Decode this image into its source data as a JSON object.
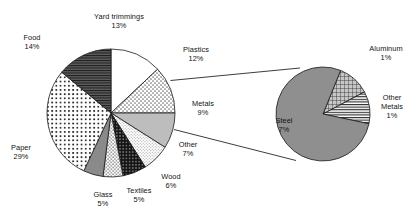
{
  "figure": {
    "background_color": "#ffffff",
    "text_color": "#141414"
  },
  "chart_data": {
    "type": "pie",
    "title": "",
    "subtitle": "",
    "xlabel": "",
    "ylabel": "",
    "grid": false,
    "legend": "none",
    "label_format": "name + percent",
    "charts": [
      {
        "name": "main-pie",
        "categories": [
          "Yard trimmings",
          "Plastics",
          "Metals",
          "Other",
          "Wood",
          "Textiles",
          "Glass",
          "Paper",
          "Food"
        ],
        "values": [
          13,
          12,
          9,
          7,
          6,
          5,
          5,
          29,
          14
        ],
        "units": "percent",
        "start_angle_deg": 0,
        "direction": "clockwise",
        "total": 100
      },
      {
        "name": "metals-detail-pie",
        "parent_slice": "Metals",
        "categories": [
          "Steel",
          "Aluminum",
          "Other Metals"
        ],
        "values": [
          7,
          1,
          1
        ],
        "units": "percent",
        "start_angle_deg": 0,
        "direction": "clockwise",
        "total": 9
      }
    ]
  },
  "main_pie": {
    "name": "main-pie",
    "slices": [
      {
        "key": "yard-trimmings",
        "label": "Yard trimmings",
        "percent": "13%",
        "value": 13,
        "fill": "white",
        "color": "#ffffff"
      },
      {
        "key": "plastics",
        "label": "Plastics",
        "percent": "12%",
        "value": 12,
        "fill": "stipple-coarse",
        "color": "#d8d8d8"
      },
      {
        "key": "metals",
        "label": "Metals",
        "percent": "9%",
        "value": 9,
        "fill": "solid-light-gray",
        "color": "#bdbdbd"
      },
      {
        "key": "other",
        "label": "Other",
        "percent": "7%",
        "value": 7,
        "fill": "stipple-fine",
        "color": "#ececec"
      },
      {
        "key": "wood",
        "label": "Wood",
        "percent": "6%",
        "value": 6,
        "fill": "crosshatch-dark",
        "color": "#2b2b2b"
      },
      {
        "key": "textiles",
        "label": "Textiles",
        "percent": "5%",
        "value": 5,
        "fill": "stipple-medium",
        "color": "#cfcfcf"
      },
      {
        "key": "glass",
        "label": "Glass",
        "percent": "5%",
        "value": 5,
        "fill": "solid-mid-gray",
        "color": "#8a8a8a"
      },
      {
        "key": "paper",
        "label": "Paper",
        "percent": "29%",
        "value": 29,
        "fill": "dot-grid-bold",
        "color": "#e8e8e8"
      },
      {
        "key": "food",
        "label": "Food",
        "percent": "14%",
        "value": 14,
        "fill": "horizontal-lines-dark",
        "color": "#6e6e6e"
      }
    ]
  },
  "detail_pie": {
    "name": "metals-detail-pie",
    "slices": [
      {
        "key": "steel",
        "label": "Steel",
        "percent": "7%",
        "value": 7,
        "fill": "solid-gray",
        "color": "#8f8f8f"
      },
      {
        "key": "aluminum",
        "label": "Aluminum",
        "percent": "1%",
        "value": 1,
        "fill": "crosshatch-grid",
        "color": "#cacaca"
      },
      {
        "key": "other-metals",
        "label": "Other Metals",
        "percent": "1%",
        "value": 1,
        "fill": "horizontal-lines",
        "color": "#d6d6d6"
      }
    ]
  }
}
